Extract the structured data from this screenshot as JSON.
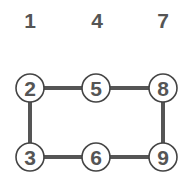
{
  "diagram": {
    "colors": {
      "text": "#555555",
      "edge": "#555555",
      "node_stroke": "#444444",
      "node_fill": "#ffffff",
      "background": "#ffffff"
    },
    "top_labels": [
      {
        "text": "1",
        "x": 30,
        "y": 28
      },
      {
        "text": "4",
        "x": 97,
        "y": 28
      },
      {
        "text": "7",
        "x": 163,
        "y": 28
      }
    ],
    "nodes": [
      {
        "id": "2",
        "label": "2",
        "x": 30,
        "y": 88
      },
      {
        "id": "5",
        "label": "5",
        "x": 96,
        "y": 88
      },
      {
        "id": "8",
        "label": "8",
        "x": 163,
        "y": 88
      },
      {
        "id": "3",
        "label": "3",
        "x": 30,
        "y": 157
      },
      {
        "id": "6",
        "label": "6",
        "x": 96,
        "y": 157
      },
      {
        "id": "9",
        "label": "9",
        "x": 163,
        "y": 157
      }
    ],
    "edges": [
      {
        "from": "2",
        "to": "5"
      },
      {
        "from": "5",
        "to": "8"
      },
      {
        "from": "2",
        "to": "3"
      },
      {
        "from": "8",
        "to": "9"
      },
      {
        "from": "3",
        "to": "6"
      },
      {
        "from": "6",
        "to": "9"
      }
    ]
  }
}
